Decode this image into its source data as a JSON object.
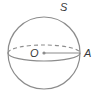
{
  "diagram": {
    "type": "sphere",
    "labels": {
      "sphere": "S",
      "center": "O",
      "surface_point": "A"
    },
    "colors": {
      "stroke": "#8c8c8c",
      "text": "#3a3a3a"
    }
  }
}
